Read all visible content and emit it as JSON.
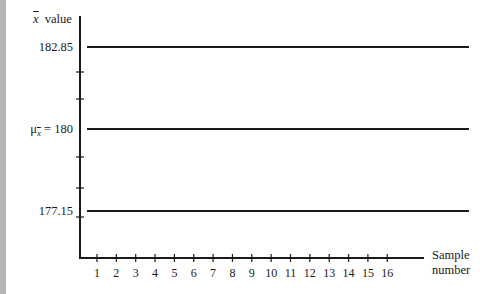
{
  "chart_data": {
    "type": "line",
    "title": "",
    "xlabel": "Sample number",
    "ylabel": "x̄ value",
    "categories": [
      1,
      2,
      3,
      4,
      5,
      6,
      7,
      8,
      9,
      10,
      11,
      12,
      13,
      14,
      15,
      16
    ],
    "series": [
      {
        "name": "Upper limit",
        "values": [
          182.85,
          182.85,
          182.85,
          182.85,
          182.85,
          182.85,
          182.85,
          182.85,
          182.85,
          182.85,
          182.85,
          182.85,
          182.85,
          182.85,
          182.85,
          182.85
        ]
      },
      {
        "name": "Center line (μx̄ = 180)",
        "values": [
          180,
          180,
          180,
          180,
          180,
          180,
          180,
          180,
          180,
          180,
          180,
          180,
          180,
          180,
          180,
          180
        ]
      },
      {
        "name": "Lower limit",
        "values": [
          177.15,
          177.15,
          177.15,
          177.15,
          177.15,
          177.15,
          177.15,
          177.15,
          177.15,
          177.15,
          177.15,
          177.15,
          177.15,
          177.15,
          177.15,
          177.15
        ]
      }
    ],
    "y_tick_labels": [
      "182.85",
      "μx̄ = 180",
      "177.15"
    ],
    "x_tick_labels": [
      "1",
      "2",
      "3",
      "4",
      "5",
      "6",
      "7",
      "8",
      "9",
      "10",
      "11",
      "12",
      "13",
      "14",
      "15",
      "16"
    ],
    "grid": false,
    "legend": "none"
  },
  "labels": {
    "y_axis_symbol": "x",
    "y_axis_word": "value",
    "upper": "182.85",
    "center_mu": "μ",
    "center_sub": "x",
    "center_value": "= 180",
    "lower": "177.15",
    "x_axis_line1": "Sample",
    "x_axis_line2": "number"
  }
}
